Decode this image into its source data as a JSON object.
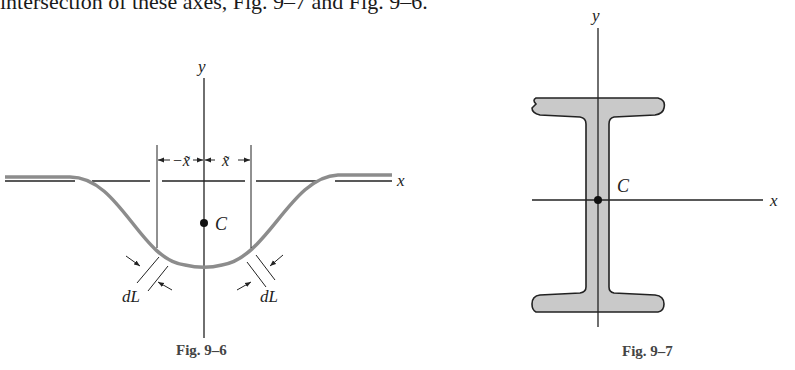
{
  "page": {
    "top_text": "intersection of these axes, Fig. 9–7 and Fig. 9–6."
  },
  "figures": [
    {
      "id": "fig-9-6",
      "caption": "Fig. 9–6",
      "labels": {
        "y_axis": "y",
        "x_axis": "x",
        "centroid": "C",
        "left_dim": "−x̃",
        "right_dim": "x̃",
        "left_element": "dL",
        "right_element": "dL"
      }
    },
    {
      "id": "fig-9-7",
      "caption": "Fig. 9–7",
      "labels": {
        "y_axis": "y",
        "x_axis": "x",
        "centroid": "C"
      }
    }
  ],
  "colors": {
    "curve": "#8c8c8c",
    "section_fill": "#c9c9c9",
    "line": "#222222"
  }
}
